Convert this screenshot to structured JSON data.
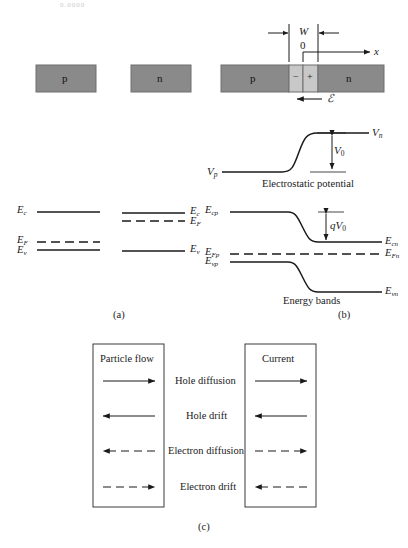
{
  "figure": {
    "cut_text": "0.0000",
    "panel_labels": {
      "a": "(a)",
      "b": "(b)",
      "c": "(c)"
    }
  },
  "panel_a": {
    "block_p": "p",
    "block_n": "n",
    "bands_left": {
      "ec": "E",
      "ec_sub": "c",
      "ef": "E",
      "ef_sub": "F",
      "ev": "E",
      "ev_sub": "v"
    },
    "bands_right": {
      "ec": "E",
      "ec_sub": "c",
      "ef": "E",
      "ef_sub": "F",
      "ev": "E",
      "ev_sub": "v"
    }
  },
  "panel_b": {
    "axis": {
      "width_label": "W",
      "origin_label": "0",
      "x_label": "x"
    },
    "junction": {
      "p_label": "p",
      "n_label": "n",
      "minus": "−",
      "plus": "+",
      "field_label": "ℰ"
    },
    "potential": {
      "caption": "Electrostatic potential",
      "v_p": "V",
      "v_p_sub": "p",
      "v_n": "V",
      "v_n_sub": "n",
      "v_0": "V",
      "v_0_sub": "0"
    },
    "energy": {
      "caption": "Energy bands",
      "qv0": "qV",
      "qv0_sub": "0",
      "ecp": "E",
      "ecp_sub": "cp",
      "efp": "E",
      "efp_sub": "Fp",
      "evp": "E",
      "evp_sub": "vp",
      "ecn": "E",
      "ecn_sub": "cn",
      "efn": "E",
      "efn_sub": "Fn",
      "evn": "E",
      "evn_sub": "vn"
    }
  },
  "panel_c": {
    "header_left": "Particle flow",
    "header_right": "Current",
    "rows": [
      {
        "label": "Hole diffusion",
        "particle_dir": "right",
        "particle_style": "solid",
        "current_dir": "right",
        "current_style": "solid"
      },
      {
        "label": "Hole drift",
        "particle_dir": "left",
        "particle_style": "solid",
        "current_dir": "left",
        "current_style": "solid"
      },
      {
        "label": "Electron diffusion",
        "particle_dir": "left",
        "particle_style": "dashed",
        "current_dir": "right",
        "current_style": "dashed"
      },
      {
        "label": "Electron drift",
        "particle_dir": "right",
        "particle_style": "dashed",
        "current_dir": "left",
        "current_style": "dashed"
      }
    ]
  },
  "colors": {
    "semiconductor_fill": "#8a8a8a",
    "depletion_fill": "#c8c8c8",
    "line": "#1a1a1a",
    "box_border": "#3a3a3a"
  }
}
